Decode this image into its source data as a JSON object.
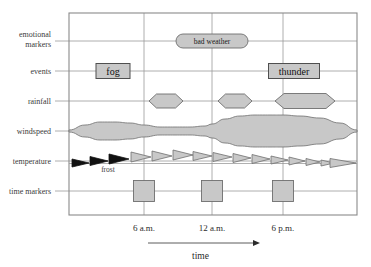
{
  "chart_data": {
    "type": "diagram",
    "title": "",
    "xlabel": "time",
    "ylabel": "",
    "grid": true,
    "legend_position": "none",
    "x_axis": {
      "label": "time",
      "tick_labels": [
        "6 a.m.",
        "12 a.m.",
        "6 p.m."
      ],
      "tick_x": [
        144,
        212,
        283
      ],
      "range_px": [
        69,
        357
      ],
      "arrow": "right"
    },
    "rows": [
      {
        "key": "emotional_markers",
        "label_line1": "emotional",
        "label_line2": "markers",
        "y": 41
      },
      {
        "key": "events",
        "label_line1": "events",
        "label_line2": "",
        "y": 71
      },
      {
        "key": "rainfall",
        "label_line1": "rainfall",
        "label_line2": "",
        "y": 101
      },
      {
        "key": "windspeed",
        "label_line1": "windspeed",
        "label_line2": "",
        "y": 131
      },
      {
        "key": "temperature",
        "label_line1": "temperature",
        "label_line2": "",
        "y": 161
      },
      {
        "key": "time_markers",
        "label_line1": "time markers",
        "label_line2": "",
        "y": 191
      }
    ],
    "emotional_markers": [
      {
        "label": "bad weather",
        "cx": 212,
        "cy": 41,
        "w": 72,
        "h": 14,
        "shape": "lozenge"
      }
    ],
    "events": [
      {
        "label": "fog",
        "cx": 113,
        "cy": 71,
        "w": 34,
        "h": 15,
        "shape": "rect"
      },
      {
        "label": "thunder",
        "cx": 294,
        "cy": 71,
        "w": 51,
        "h": 15,
        "shape": "rect"
      }
    ],
    "rainfall": [
      {
        "cx": 166,
        "cy": 101,
        "w": 34,
        "h": 14,
        "shape": "hexagon",
        "intensity": 1
      },
      {
        "cx": 235,
        "cy": 101,
        "w": 34,
        "h": 14,
        "shape": "hexagon",
        "intensity": 1
      },
      {
        "cx": 305,
        "cy": 101,
        "w": 60,
        "h": 15,
        "shape": "hexagon",
        "intensity": 2
      }
    ],
    "windspeed": {
      "baseline_y": 131,
      "shape": "ribbon",
      "samples_x": [
        69,
        85,
        100,
        115,
        130,
        144,
        160,
        175,
        190,
        205,
        212,
        225,
        240,
        255,
        270,
        283,
        300,
        320,
        340,
        357
      ],
      "half_thickness": [
        1,
        6,
        9,
        9,
        8,
        6,
        4,
        4,
        4,
        5,
        7,
        12,
        15,
        16,
        16,
        16,
        15,
        13,
        8,
        1
      ]
    },
    "temperature": {
      "note": "frost",
      "note_x": 108,
      "note_y": 172,
      "arrows": [
        {
          "x": 72,
          "y": 163,
          "w": 17,
          "h": 8,
          "color": "black"
        },
        {
          "x": 90,
          "y": 161,
          "w": 18,
          "h": 9,
          "color": "black"
        },
        {
          "x": 109,
          "y": 159,
          "w": 20,
          "h": 10,
          "color": "black"
        },
        {
          "x": 131,
          "y": 157,
          "w": 20,
          "h": 10,
          "color": "gray"
        },
        {
          "x": 152,
          "y": 156,
          "w": 20,
          "h": 10,
          "color": "gray"
        },
        {
          "x": 173,
          "y": 155,
          "w": 20,
          "h": 10,
          "color": "gray"
        },
        {
          "x": 193,
          "y": 156,
          "w": 19,
          "h": 9,
          "color": "gray"
        },
        {
          "x": 213,
          "y": 157,
          "w": 19,
          "h": 9,
          "color": "gray"
        },
        {
          "x": 233,
          "y": 158,
          "w": 18,
          "h": 9,
          "color": "gray"
        },
        {
          "x": 252,
          "y": 159,
          "w": 18,
          "h": 9,
          "color": "gray"
        },
        {
          "x": 271,
          "y": 160,
          "w": 17,
          "h": 8,
          "color": "gray"
        },
        {
          "x": 289,
          "y": 161,
          "w": 16,
          "h": 8,
          "color": "gray"
        },
        {
          "x": 306,
          "y": 162,
          "w": 14,
          "h": 7,
          "color": "gray"
        },
        {
          "x": 321,
          "y": 163,
          "w": 13,
          "h": 6,
          "color": "gray"
        },
        {
          "x": 330,
          "y": 163,
          "w": 26,
          "h": 9,
          "color": "gray"
        }
      ]
    },
    "time_markers": [
      {
        "cx": 144,
        "cy": 191,
        "size": 21
      },
      {
        "cx": 212,
        "cy": 191,
        "size": 21
      },
      {
        "cx": 283,
        "cy": 191,
        "size": 21
      }
    ],
    "frame": {
      "x": 69,
      "y": 13,
      "w": 288,
      "h": 202
    },
    "colors": {
      "shape_fill": "#c8c8c8",
      "shape_stroke": "#6e6e6e",
      "dark_fill": "#111111",
      "grid": "#9a9a9a",
      "frame": "#8a8a8a",
      "text": "#2b2b2b",
      "background": "#ffffff"
    }
  }
}
